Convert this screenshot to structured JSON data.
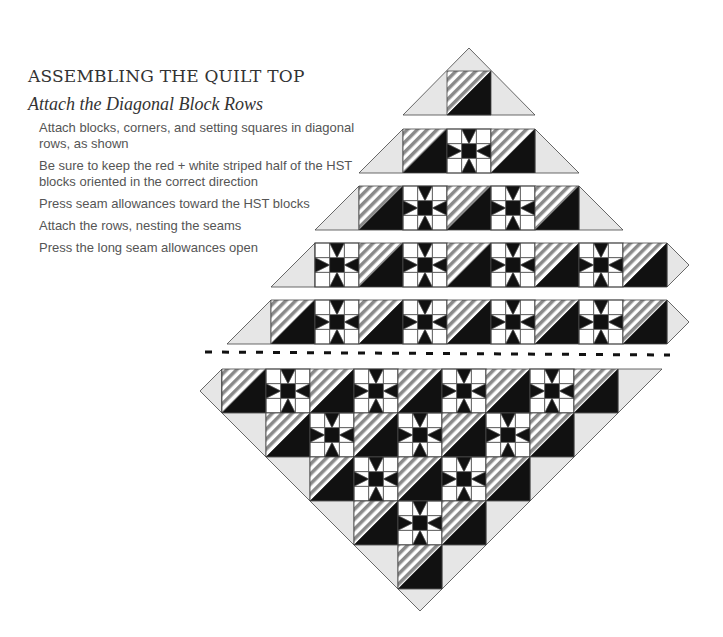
{
  "heading": {
    "title": "ASSEMBLING THE QUILT TOP",
    "subtitle": "Attach the Diagonal Block Rows"
  },
  "steps": [
    "Attach blocks, corners, and setting squares in diagonal rows, as shown",
    "Be sure to keep the red + white striped half of the HST blocks oriented in the correct direction",
    "Press seam allowances toward the HST blocks",
    "Attach the rows, nesting the seams",
    "Press the long seam allowances open"
  ],
  "diagram": {
    "colors": {
      "dark": "#111111",
      "light": "#e6e6e6",
      "stripe": "#8a8a8a",
      "outline": "#444444"
    },
    "block_size": 44,
    "top_rows": [
      {
        "y": 71,
        "x": 447,
        "blocks": [
          "H"
        ],
        "left_tri": 22,
        "right_tri": 22,
        "apex": true
      },
      {
        "y": 129,
        "x": 403,
        "blocks": [
          "H",
          "S",
          "H"
        ],
        "left_tri": 44,
        "right_tri": 44
      },
      {
        "y": 186,
        "x": 359,
        "blocks": [
          "H",
          "S",
          "H",
          "S",
          "H"
        ],
        "left_tri": 44,
        "right_tri": 44
      },
      {
        "y": 243,
        "x": 315,
        "blocks": [
          "S",
          "H",
          "S",
          "H",
          "S",
          "H",
          "S",
          "H"
        ],
        "left_tri": 44,
        "right_tri": 0,
        "right_point": true
      },
      {
        "y": 300,
        "x": 271,
        "blocks": [
          "H",
          "S",
          "H",
          "S",
          "H",
          "S",
          "H",
          "S",
          "H"
        ],
        "left_tri": 44,
        "right_tri": 0,
        "right_point": true
      }
    ],
    "separator": {
      "y": 352,
      "x1": 205,
      "x2": 670,
      "label": "dashed-seam-line"
    },
    "bottom_rows": [
      {
        "y": 369,
        "x": 222,
        "blocks": [
          "H",
          "S",
          "H",
          "S",
          "H",
          "S",
          "H",
          "S",
          "H"
        ]
      },
      {
        "y": 413,
        "x": 266,
        "blocks": [
          "H",
          "S",
          "H",
          "S",
          "H",
          "S",
          "H"
        ]
      },
      {
        "y": 457,
        "x": 310,
        "blocks": [
          "H",
          "S",
          "H",
          "S",
          "H"
        ]
      },
      {
        "y": 501,
        "x": 354,
        "blocks": [
          "H",
          "S",
          "H"
        ]
      },
      {
        "y": 545,
        "x": 398,
        "blocks": [
          "H"
        ]
      }
    ],
    "legend": {
      "H": "half-square-triangle block (striped + dark)",
      "S": "sawtooth star block"
    }
  }
}
